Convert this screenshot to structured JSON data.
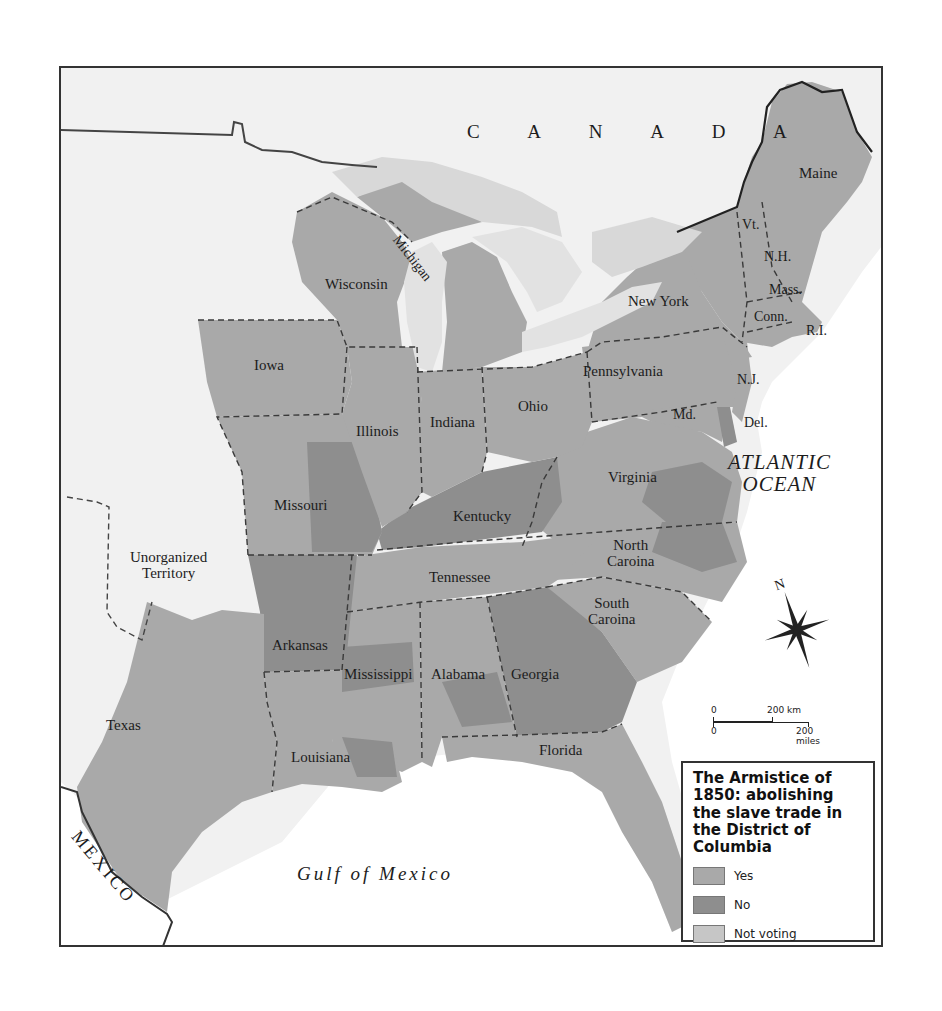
{
  "map": {
    "title": "The Armistice of 1850: abolishing the slave trade in the District of Columbia",
    "countries": {
      "canada": "C A N A D A",
      "mexico": "MEXICO"
    },
    "water": {
      "atlantic_line1": "ATLANTIC",
      "atlantic_line2": "OCEAN",
      "gulf": "Gulf of Mexico"
    },
    "territory": {
      "line1": "Unorganized",
      "line2": "Territory"
    },
    "states": {
      "maine": "Maine",
      "vermont": "Vt.",
      "new_hampshire": "N.H.",
      "massachusetts": "Mass.",
      "connecticut": "Conn.",
      "rhode_island": "R.I.",
      "new_york": "New York",
      "new_jersey": "N.J.",
      "pennsylvania": "Pennsylvania",
      "delaware": "Del.",
      "maryland": "Md.",
      "virginia": "Virginia",
      "north_carolina_1": "North",
      "north_carolina_2": "Caroina",
      "south_carolina_1": "South",
      "south_carolina_2": "Caroina",
      "georgia": "Georgia",
      "florida": "Florida",
      "alabama": "Alabama",
      "mississippi": "Mississippi",
      "louisiana": "Louisiana",
      "tennessee": "Tennessee",
      "kentucky": "Kentucky",
      "ohio": "Ohio",
      "indiana": "Indiana",
      "illinois": "Illinois",
      "michigan": "Michigan",
      "wisconsin": "Wisconsin",
      "iowa": "Iowa",
      "missouri": "Missouri",
      "arkansas": "Arkansas",
      "texas": "Texas"
    },
    "compass": {
      "north": "N"
    },
    "scale": {
      "km_zero": "0",
      "km_label": "200 km",
      "mi_zero": "0",
      "mi_label": "200 miles"
    }
  },
  "legend": {
    "title": "The Armistice of 1850: abolishing the slave trade in the District of Columbia",
    "items": [
      {
        "label": "Yes",
        "color": "#a9a9a9"
      },
      {
        "label": "No",
        "color": "#8e8e8e"
      },
      {
        "label": "Not voting",
        "color": "#c6c6c6"
      }
    ]
  },
  "colors": {
    "yes": "#a9a9a9",
    "no": "#8e8e8e",
    "not_voting": "#c6c6c6",
    "land_outside": "#f1f1f1",
    "water": "#ffffff",
    "lakes": "#d8d8d8"
  }
}
